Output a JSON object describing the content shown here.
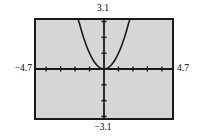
{
  "screen": {
    "title": "Graphing calculator viewing window",
    "background_color": "#ffffff",
    "plot_background_color": "#d6d6d6",
    "frame_color": "#1a1a1a",
    "curve_color": "#1a1a1a",
    "axis_color": "#1a1a1a"
  },
  "labels": {
    "ymax": "3.1",
    "ymin": "−3.1",
    "xmin": "−4.7",
    "xmax": "4.7"
  },
  "chart_data": {
    "type": "line",
    "title": "",
    "xlabel": "",
    "ylabel": "",
    "xlim": [
      -4.7,
      4.7
    ],
    "ylim": [
      -3.1,
      3.1
    ],
    "grid": false,
    "legend": "none",
    "xticks": [
      -4,
      -3,
      -2,
      -1,
      0,
      1,
      2,
      3,
      4
    ],
    "yticks": [
      -3,
      -2,
      -1,
      0,
      1,
      2,
      3
    ],
    "xtick_labels": [],
    "ytick_labels": [],
    "axis_style": "crosshair-centered",
    "window": {
      "Xmin": -4.7,
      "Xmax": 4.7,
      "Xscl": 1,
      "Ymin": -3.1,
      "Ymax": 3.1,
      "Yscl": 1
    },
    "series": [
      {
        "name": "y = x²",
        "expression": "x^2",
        "x": [
          -1.78,
          -1.7,
          -1.6,
          -1.5,
          -1.4,
          -1.3,
          -1.2,
          -1.1,
          -1.0,
          -0.9,
          -0.8,
          -0.7,
          -0.6,
          -0.5,
          -0.4,
          -0.3,
          -0.2,
          -0.1,
          0.0,
          0.1,
          0.2,
          0.3,
          0.4,
          0.5,
          0.6,
          0.7,
          0.8,
          0.9,
          1.0,
          1.1,
          1.2,
          1.3,
          1.4,
          1.5,
          1.6,
          1.7,
          1.78
        ],
        "y": [
          3.1,
          2.89,
          2.56,
          2.25,
          1.96,
          1.69,
          1.44,
          1.21,
          1.0,
          0.81,
          0.64,
          0.49,
          0.36,
          0.25,
          0.16,
          0.09,
          0.04,
          0.01,
          0.0,
          0.01,
          0.04,
          0.09,
          0.16,
          0.25,
          0.36,
          0.49,
          0.64,
          0.81,
          1.0,
          1.21,
          1.44,
          1.69,
          1.96,
          2.25,
          2.56,
          2.89,
          3.1
        ]
      }
    ],
    "vertex": [
      0,
      0
    ]
  }
}
